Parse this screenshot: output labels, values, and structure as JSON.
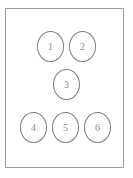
{
  "diagram": {
    "type": "node-layout",
    "title": "",
    "frame": {
      "shape": "rectangle",
      "border_color": "#9a9a9a",
      "fill_color": "#ffffff",
      "x": 5,
      "y": 8,
      "width": 119,
      "height": 160
    },
    "node_style": {
      "shape": "ellipse",
      "border_color": "#7d7d7d",
      "fill_color": "#ffffff",
      "label_color": "#8d8d8d",
      "width": 27,
      "height": 31
    },
    "rows": [
      {
        "row_index": 1,
        "count": 2
      },
      {
        "row_index": 2,
        "count": 1
      },
      {
        "row_index": 3,
        "count": 3
      }
    ],
    "nodes": [
      {
        "label": "1",
        "row": 1,
        "x": 37,
        "y": 31
      },
      {
        "label": "2",
        "row": 1,
        "x": 69,
        "y": 31
      },
      {
        "label": "3",
        "row": 2,
        "x": 53,
        "y": 69
      },
      {
        "label": "4",
        "row": 3,
        "x": 20,
        "y": 112
      },
      {
        "label": "5",
        "row": 3,
        "x": 52,
        "y": 112
      },
      {
        "label": "6",
        "row": 3,
        "x": 84,
        "y": 112
      }
    ]
  }
}
